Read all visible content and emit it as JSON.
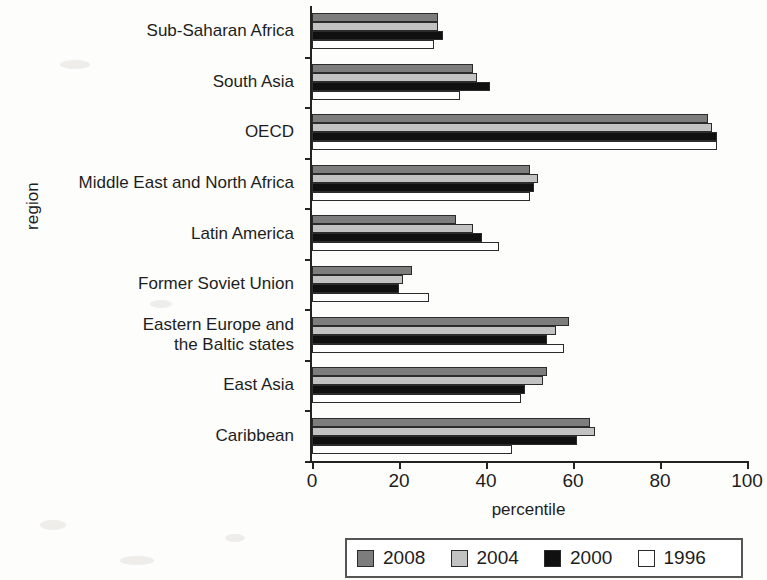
{
  "axes": {
    "y_title": "region",
    "x_title": "percentile"
  },
  "legend": {
    "items": [
      {
        "label": "2008",
        "color": "#7d7d7d"
      },
      {
        "label": "2004",
        "color": "#c2c2c2"
      },
      {
        "label": "2000",
        "color": "#101010"
      },
      {
        "label": "1996",
        "color": "#ffffff"
      }
    ]
  },
  "chart_data": {
    "type": "bar",
    "orientation": "horizontal",
    "title": "",
    "xlabel": "percentile",
    "ylabel": "region",
    "xlim": [
      0,
      100
    ],
    "xticks": [
      0,
      20,
      40,
      60,
      80,
      100
    ],
    "grid": false,
    "legend_position": "bottom",
    "categories": [
      "Sub-Saharan Africa",
      "South Asia",
      "OECD",
      "Middle East and North Africa",
      "Latin America",
      "Former Soviet Union",
      "Eastern Europe and the Baltic states",
      "East Asia",
      "Caribbean"
    ],
    "series": [
      {
        "name": "2008",
        "color": "#7d7d7d",
        "values": [
          29,
          37,
          91,
          50,
          33,
          23,
          59,
          54,
          64
        ]
      },
      {
        "name": "2004",
        "color": "#c2c2c2",
        "values": [
          29,
          38,
          92,
          52,
          37,
          21,
          56,
          53,
          65
        ]
      },
      {
        "name": "2000",
        "color": "#101010",
        "values": [
          30,
          41,
          93,
          51,
          39,
          20,
          54,
          49,
          61
        ]
      },
      {
        "name": "1996",
        "color": "#ffffff",
        "values": [
          28,
          34,
          93,
          50,
          43,
          27,
          58,
          48,
          46
        ]
      }
    ]
  }
}
